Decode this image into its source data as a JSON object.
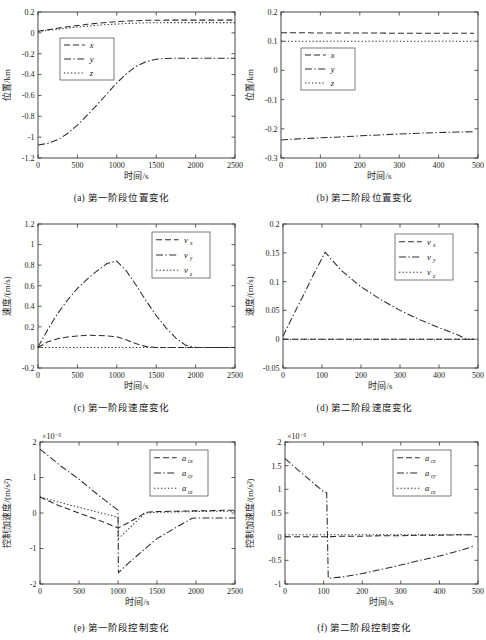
{
  "figure": {
    "axis_color": "#2b2b2b",
    "background": "#ffffff",
    "legend_border": "#5a5a5a"
  },
  "panels": [
    {
      "id": "a",
      "caption": "(a) 第一阶段位置变化",
      "xlabel": "时间/s",
      "ylabel": "位置/km",
      "exponent": "",
      "legend": [
        {
          "label": "x",
          "sub": "",
          "dash": "dashed"
        },
        {
          "label": "y",
          "sub": "",
          "dash": "dashdot"
        },
        {
          "label": "z",
          "sub": "",
          "dash": "dotted"
        }
      ]
    },
    {
      "id": "b",
      "caption": "(b) 第二阶段位置变化",
      "xlabel": "时间/s",
      "ylabel": "位置/km",
      "exponent": "",
      "legend": [
        {
          "label": "x",
          "sub": "",
          "dash": "dashed"
        },
        {
          "label": "y",
          "sub": "",
          "dash": "dashdot"
        },
        {
          "label": "z",
          "sub": "",
          "dash": "dotted"
        }
      ]
    },
    {
      "id": "c",
      "caption": "(c) 第一阶段速度变化",
      "xlabel": "时间/s",
      "ylabel": "速度/(m/s)",
      "exponent": "",
      "legend": [
        {
          "label": "v",
          "sub": "x",
          "dash": "dashed"
        },
        {
          "label": "v",
          "sub": "y",
          "dash": "dashdot"
        },
        {
          "label": "v",
          "sub": "z",
          "dash": "dotted"
        }
      ]
    },
    {
      "id": "d",
      "caption": "(d) 第二阶段速度变化",
      "xlabel": "时间/s",
      "ylabel": "速度/(m/s)",
      "exponent": "",
      "legend": [
        {
          "label": "v",
          "sub": "x",
          "dash": "dashed"
        },
        {
          "label": "v",
          "sub": "y",
          "dash": "dashdot"
        },
        {
          "label": "v",
          "sub": "z",
          "dash": "dotted"
        }
      ]
    },
    {
      "id": "e",
      "caption": "(e) 第一阶段控制变化",
      "xlabel": "时间/s",
      "ylabel": "控制加速度/(m/s²)",
      "exponent": "×10⁻³",
      "legend": [
        {
          "label": "a",
          "sub": "cx",
          "dash": "dashed"
        },
        {
          "label": "a",
          "sub": "cy",
          "dash": "dashdot"
        },
        {
          "label": "a",
          "sub": "cz",
          "dash": "dotted"
        }
      ]
    },
    {
      "id": "f",
      "caption": "(f) 第二阶段控制变化",
      "xlabel": "时间/s",
      "ylabel": "控制加速度/(m/s²)",
      "exponent": "×10⁻³",
      "legend": [
        {
          "label": "a",
          "sub": "cx",
          "dash": "dashed"
        },
        {
          "label": "a",
          "sub": "cy",
          "dash": "dashdot"
        },
        {
          "label": "a",
          "sub": "cz",
          "dash": "dotted"
        }
      ]
    }
  ],
  "chart_data": [
    {
      "type": "line",
      "panel": "a",
      "title": "(a) 第一阶段位置变化",
      "xlabel": "时间/s",
      "ylabel": "位置/km",
      "xlim": [
        0,
        2500
      ],
      "ylim": [
        -1.2,
        0.2
      ],
      "xticks": [
        0,
        500,
        1000,
        1500,
        2000,
        2500
      ],
      "yticks": [
        -1.2,
        -1,
        -0.8,
        -0.6,
        -0.4,
        -0.2,
        0,
        0.2
      ],
      "grid": false,
      "legend_position": "upper-left-inset",
      "x": [
        0,
        125,
        250,
        375,
        500,
        625,
        750,
        875,
        1000,
        1125,
        1250,
        1375,
        1500,
        1625,
        1750,
        1875,
        2000,
        2125,
        2250,
        2375,
        2500
      ],
      "series": [
        {
          "name": "x",
          "style": "dashed",
          "values": [
            0.015,
            0.03,
            0.045,
            0.058,
            0.07,
            0.082,
            0.092,
            0.1,
            0.108,
            0.113,
            0.117,
            0.12,
            0.121,
            0.122,
            0.122,
            0.122,
            0.122,
            0.122,
            0.122,
            0.122,
            0.122
          ]
        },
        {
          "name": "y",
          "style": "dashdot",
          "values": [
            -1.075,
            -1.06,
            -1.025,
            -0.965,
            -0.885,
            -0.79,
            -0.69,
            -0.585,
            -0.48,
            -0.39,
            -0.32,
            -0.275,
            -0.253,
            -0.245,
            -0.243,
            -0.243,
            -0.243,
            -0.243,
            -0.243,
            -0.243,
            -0.243
          ]
        },
        {
          "name": "z",
          "style": "dotted",
          "values": [
            0.012,
            0.024,
            0.035,
            0.046,
            0.056,
            0.064,
            0.072,
            0.079,
            0.085,
            0.09,
            0.093,
            0.096,
            0.097,
            0.098,
            0.098,
            0.098,
            0.098,
            0.098,
            0.098,
            0.098,
            0.098
          ]
        }
      ]
    },
    {
      "type": "line",
      "panel": "b",
      "title": "(b) 第二阶段位置变化",
      "xlabel": "时间/s",
      "ylabel": "位置/km",
      "xlim": [
        0,
        500
      ],
      "ylim": [
        -0.3,
        0.2
      ],
      "xticks": [
        0,
        100,
        200,
        300,
        400,
        500
      ],
      "yticks": [
        -0.3,
        -0.2,
        -0.1,
        0,
        0.1,
        0.2
      ],
      "grid": false,
      "legend_position": "center-left-inset",
      "x": [
        0,
        50,
        100,
        150,
        200,
        250,
        300,
        350,
        400,
        450,
        490
      ],
      "series": [
        {
          "name": "x",
          "style": "dashed",
          "values": [
            0.129,
            0.129,
            0.128,
            0.128,
            0.128,
            0.128,
            0.127,
            0.127,
            0.127,
            0.127,
            0.127
          ]
        },
        {
          "name": "y",
          "style": "dashdot",
          "values": [
            -0.238,
            -0.234,
            -0.231,
            -0.228,
            -0.224,
            -0.221,
            -0.218,
            -0.215,
            -0.213,
            -0.211,
            -0.21
          ]
        },
        {
          "name": "z",
          "style": "dotted",
          "values": [
            0.1,
            0.1,
            0.1,
            0.1,
            0.1,
            0.1,
            0.1,
            0.1,
            0.1,
            0.1,
            0.1
          ]
        }
      ]
    },
    {
      "type": "line",
      "panel": "c",
      "title": "(c) 第一阶段速度变化",
      "xlabel": "时间/s",
      "ylabel": "速度/(m/s)",
      "xlim": [
        0,
        2500
      ],
      "ylim": [
        -0.2,
        1.2
      ],
      "xticks": [
        0,
        500,
        1000,
        1500,
        2000,
        2500
      ],
      "yticks": [
        -0.2,
        0,
        0.2,
        0.4,
        0.6,
        0.8,
        1,
        1.2
      ],
      "grid": false,
      "legend_position": "upper-right-inset",
      "x": [
        0,
        125,
        250,
        375,
        500,
        625,
        750,
        875,
        1000,
        1125,
        1250,
        1375,
        1500,
        1625,
        1750,
        1875,
        2000,
        2250,
        2500
      ],
      "series": [
        {
          "name": "v_x",
          "style": "dashed",
          "values": [
            0.0,
            0.055,
            0.085,
            0.102,
            0.112,
            0.118,
            0.116,
            0.112,
            0.104,
            0.072,
            0.035,
            0.008,
            0.0,
            0.0,
            0.0,
            0.0,
            0.0,
            0.0,
            0.0
          ]
        },
        {
          "name": "v_y",
          "style": "dashdot",
          "values": [
            0.005,
            0.175,
            0.33,
            0.46,
            0.575,
            0.665,
            0.745,
            0.815,
            0.84,
            0.74,
            0.6,
            0.45,
            0.31,
            0.19,
            0.09,
            0.02,
            0.0,
            0.0,
            0.0
          ]
        },
        {
          "name": "v_z",
          "style": "dotted",
          "values": [
            0.0,
            0.0,
            0.0,
            0.0,
            0.0,
            0.0,
            0.0,
            0.0,
            0.0,
            0.0,
            0.0,
            0.0,
            0.0,
            0.0,
            0.0,
            0.0,
            0.0,
            0.0,
            0.0
          ]
        }
      ]
    },
    {
      "type": "line",
      "panel": "d",
      "title": "(d) 第二阶段速度变化",
      "xlabel": "时间/s",
      "ylabel": "速度/(m/s)",
      "xlim": [
        0,
        500
      ],
      "ylim": [
        -0.05,
        0.2
      ],
      "xticks": [
        0,
        100,
        200,
        300,
        400,
        500
      ],
      "yticks": [
        -0.05,
        0,
        0.05,
        0.1,
        0.15,
        0.2
      ],
      "grid": false,
      "legend_position": "upper-right-inset",
      "x": [
        0,
        25,
        50,
        75,
        108,
        150,
        200,
        250,
        300,
        350,
        400,
        450,
        470,
        490
      ],
      "series": [
        {
          "name": "v_x",
          "style": "dashed",
          "values": [
            0.0,
            0.0,
            0.0,
            0.0,
            0.0,
            0.0,
            0.0,
            0.0,
            0.0,
            0.0,
            0.0,
            0.0,
            0.0,
            0.0
          ]
        },
        {
          "name": "v_y",
          "style": "dashdot",
          "values": [
            0.005,
            0.04,
            0.073,
            0.108,
            0.151,
            0.119,
            0.091,
            0.069,
            0.05,
            0.034,
            0.02,
            0.007,
            0.0,
            0.0
          ]
        },
        {
          "name": "v_z",
          "style": "dotted",
          "values": [
            0.0,
            0.0,
            0.0,
            0.0,
            0.0,
            0.0,
            0.0,
            0.0,
            0.0,
            0.0,
            0.0,
            0.0,
            0.0,
            0.0
          ]
        }
      ]
    },
    {
      "type": "line",
      "panel": "e",
      "title": "(e) 第一阶段控制变化",
      "xlabel": "时间/s",
      "ylabel": "控制加速度/(m/s²)",
      "exponent": "×10⁻³",
      "xlim": [
        0,
        2500
      ],
      "ylim": [
        -2,
        2
      ],
      "xticks": [
        0,
        500,
        1000,
        1500,
        2000,
        2500
      ],
      "yticks": [
        -2,
        -1,
        0,
        1,
        2
      ],
      "grid": false,
      "legend_position": "upper-right-inset",
      "x": [
        0,
        250,
        500,
        750,
        1000,
        1005,
        1150,
        1300,
        1350,
        1500,
        1750,
        1950,
        2000,
        2250,
        2500
      ],
      "series": [
        {
          "name": "a_cx",
          "style": "dashed",
          "values": [
            0.45,
            0.2,
            0.0,
            -0.2,
            -0.42,
            -0.42,
            -0.25,
            -0.06,
            0.02,
            0.04,
            0.05,
            0.06,
            0.06,
            0.07,
            0.08
          ]
        },
        {
          "name": "a_cy",
          "style": "dashdot",
          "values": [
            1.8,
            1.35,
            0.95,
            0.5,
            0.08,
            -1.68,
            -1.38,
            -1.1,
            -1.0,
            -0.72,
            -0.4,
            -0.15,
            -0.14,
            -0.14,
            -0.14
          ]
        },
        {
          "name": "a_cz",
          "style": "dotted",
          "values": [
            0.45,
            0.3,
            0.16,
            0.02,
            -0.12,
            -0.72,
            -0.42,
            -0.1,
            0.0,
            0.02,
            0.03,
            0.04,
            0.04,
            0.05,
            0.05
          ]
        }
      ]
    },
    {
      "type": "line",
      "panel": "f",
      "title": "(f) 第二阶段控制变化",
      "xlabel": "时间/s",
      "ylabel": "控制加速度/(m/s²)",
      "exponent": "×10⁻³",
      "xlim": [
        0,
        500
      ],
      "ylim": [
        -1,
        2
      ],
      "xticks": [
        0,
        100,
        200,
        300,
        400,
        500
      ],
      "yticks": [
        -1,
        -0.5,
        0,
        0.5,
        1,
        1.5,
        2
      ],
      "grid": false,
      "legend_position": "upper-right-inset",
      "x": [
        0,
        25,
        50,
        75,
        100,
        108,
        112,
        150,
        200,
        250,
        300,
        350,
        400,
        450,
        490
      ],
      "series": [
        {
          "name": "a_cx",
          "style": "dashed",
          "values": [
            0.0,
            0.0,
            0.0,
            0.0,
            0.0,
            0.0,
            0.0,
            0.01,
            0.01,
            0.02,
            0.02,
            0.03,
            0.03,
            0.04,
            0.04
          ]
        },
        {
          "name": "a_cy",
          "style": "dashdot",
          "values": [
            1.65,
            1.47,
            1.3,
            1.12,
            0.95,
            0.93,
            -0.88,
            -0.85,
            -0.78,
            -0.69,
            -0.6,
            -0.5,
            -0.41,
            -0.3,
            -0.2
          ]
        },
        {
          "name": "a_cz",
          "style": "dotted",
          "values": [
            0.04,
            0.04,
            0.04,
            0.04,
            0.04,
            0.04,
            0.04,
            0.04,
            0.04,
            0.04,
            0.04,
            0.04,
            0.04,
            0.04,
            0.04
          ]
        }
      ]
    }
  ]
}
